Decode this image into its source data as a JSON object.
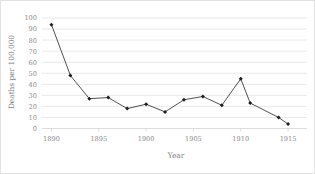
{
  "chart_data": {
    "type": "line",
    "title": "",
    "xlabel": "Year",
    "ylabel": "Deaths per 100,000",
    "xlim": [
      1889,
      1917
    ],
    "ylim": [
      0,
      100
    ],
    "xticks": [
      1890,
      1895,
      1900,
      1905,
      1910,
      1915
    ],
    "xtick_labels": [
      "1890",
      "1895",
      "1900",
      "1905",
      "1910",
      "1915"
    ],
    "yticks": [
      0,
      10,
      20,
      30,
      40,
      50,
      60,
      70,
      80,
      90,
      100
    ],
    "ytick_labels": [
      "0",
      "10",
      "20",
      "30",
      "40",
      "50",
      "60",
      "70",
      "80",
      "90",
      "100"
    ],
    "grid": "horizontal",
    "legend": "none",
    "marker": "diamond",
    "line_color": "#3c3c3c",
    "marker_color": "#1d1d1d",
    "grid_color": "#d9d9d9",
    "x": [
      1890,
      1892,
      1894,
      1896,
      1898,
      1900,
      1902,
      1904,
      1906,
      1908,
      1910,
      1911,
      1914,
      1915
    ],
    "values": [
      94,
      48,
      27,
      28,
      18,
      22,
      15,
      26,
      29,
      21,
      45,
      23,
      10,
      4
    ],
    "points": [
      {
        "x": 1890,
        "y": 94
      },
      {
        "x": 1892,
        "y": 48
      },
      {
        "x": 1894,
        "y": 27
      },
      {
        "x": 1896,
        "y": 28
      },
      {
        "x": 1898,
        "y": 18
      },
      {
        "x": 1900,
        "y": 22
      },
      {
        "x": 1902,
        "y": 15
      },
      {
        "x": 1904,
        "y": 26
      },
      {
        "x": 1906,
        "y": 29
      },
      {
        "x": 1908,
        "y": 21
      },
      {
        "x": 1910,
        "y": 45
      },
      {
        "x": 1911,
        "y": 23
      },
      {
        "x": 1914,
        "y": 10
      },
      {
        "x": 1915,
        "y": 4
      }
    ]
  }
}
